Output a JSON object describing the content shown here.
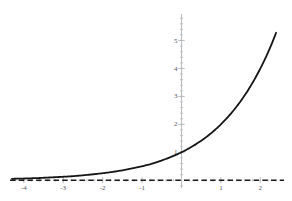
{
  "figure": {
    "title": "",
    "background_color": "#ffffff",
    "curve_color": "#151515",
    "axis_color": "#b9bbbd",
    "asymptote_color": "#1a1a1a",
    "tick_label_color": "#55575a"
  },
  "chart_data": {
    "type": "line",
    "title": "",
    "xlabel": "",
    "ylabel": "",
    "xlim": [
      -4.35,
      2.6
    ],
    "ylim": [
      -0.35,
      5.95
    ],
    "grid": false,
    "legend": null,
    "x_ticks": [
      -4,
      -3,
      -2,
      -1,
      1,
      2
    ],
    "x_tick_labels": [
      "-4",
      "-3",
      "-2",
      "-1",
      "1",
      "2"
    ],
    "y_ticks": [
      1,
      2,
      3,
      4,
      5
    ],
    "y_tick_labels": [
      "1",
      "2",
      "3",
      "4",
      "5"
    ],
    "x_minor_tick_step": 0.2,
    "y_minor_tick_step": 0.2,
    "series": [
      {
        "name": "exponential curve",
        "style": "solid",
        "color": "#151515",
        "width": 1.8,
        "expression": "y = 2^x",
        "x": [
          -4.3,
          -4.0,
          -3.6,
          -3.2,
          -2.8,
          -2.4,
          -2.0,
          -1.6,
          -1.2,
          -0.8,
          -0.4,
          0.0,
          0.4,
          0.8,
          1.2,
          1.6,
          2.0,
          2.2,
          2.4
        ],
        "y": [
          0.05,
          0.06,
          0.08,
          0.11,
          0.14,
          0.19,
          0.25,
          0.33,
          0.44,
          0.57,
          0.76,
          1.0,
          1.32,
          1.74,
          2.3,
          3.03,
          4.0,
          4.59,
          5.28
        ]
      },
      {
        "name": "horizontal asymptote",
        "style": "dashed",
        "color": "#1a1a1a",
        "width": 1.6,
        "expression": "y = 0",
        "x": [
          -4.35,
          2.6
        ],
        "y": [
          0,
          0
        ]
      }
    ],
    "annotations": []
  }
}
